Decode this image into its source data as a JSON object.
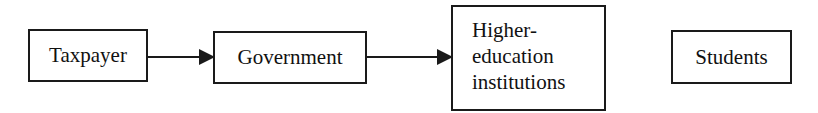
{
  "diagram": {
    "type": "flow",
    "nodes": [
      {
        "id": "taxpayer",
        "label": "Taxpayer"
      },
      {
        "id": "government",
        "label": "Government"
      },
      {
        "id": "higher_education",
        "label_lines": [
          "Higher-",
          "education",
          "institutions"
        ]
      },
      {
        "id": "students",
        "label": "Students"
      }
    ],
    "edges": [
      {
        "from": "taxpayer",
        "to": "government"
      },
      {
        "from": "government",
        "to": "higher_education"
      }
    ],
    "colors": {
      "stroke": "#1a1a1a",
      "background": "#ffffff",
      "text": "#111111"
    }
  }
}
